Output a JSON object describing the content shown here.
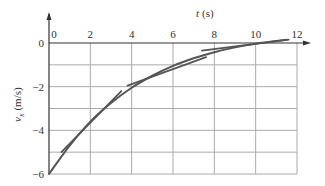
{
  "chart_data": {
    "type": "line",
    "title": "",
    "xlabel": "t (s)",
    "ylabel": "v_x (m/s)",
    "xlabel_var": "t",
    "xlabel_unit": "(s)",
    "ylabel_var": "v",
    "ylabel_sub": "x",
    "ylabel_unit": "(m/s)",
    "xlim": [
      0,
      12
    ],
    "ylim": [
      -6,
      0
    ],
    "x_ticks": [
      "0",
      "2",
      "4",
      "6",
      "8",
      "10",
      "12"
    ],
    "y_ticks": [
      "0",
      "-2",
      "-4",
      "-6"
    ],
    "grid": true,
    "x_axis_position": "top",
    "series": [
      {
        "name": "velocity curve",
        "x": [
          0,
          1,
          2,
          3,
          4,
          5,
          6,
          7,
          8,
          9,
          10,
          11.5
        ],
        "values": [
          -6,
          -4.7,
          -3.6,
          -2.75,
          -2.05,
          -1.5,
          -1.05,
          -0.7,
          -0.42,
          -0.2,
          -0.03,
          0.15
        ]
      },
      {
        "name": "tangent line 1",
        "x": [
          0.6,
          3.5
        ],
        "values": [
          -5.0,
          -2.2
        ]
      },
      {
        "name": "tangent line 2",
        "x": [
          3.8,
          7.6
        ],
        "values": [
          -1.95,
          -0.65
        ]
      },
      {
        "name": "tangent line 3",
        "x": [
          7.4,
          11.6
        ],
        "values": [
          -0.35,
          0.15
        ]
      }
    ]
  }
}
